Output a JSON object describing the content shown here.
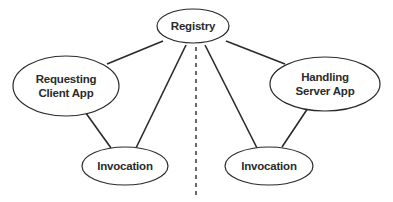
{
  "diagram": {
    "title": "",
    "nodes": [
      {
        "id": "registry",
        "lines": [
          "Registry"
        ],
        "cx": 193,
        "cy": 26,
        "rx": 36,
        "ry": 17
      },
      {
        "id": "client",
        "lines": [
          "Requesting",
          "Client App"
        ],
        "cx": 66,
        "cy": 86,
        "rx": 53,
        "ry": 30
      },
      {
        "id": "server",
        "lines": [
          "Handling",
          "Server App"
        ],
        "cx": 325,
        "cy": 84,
        "rx": 55,
        "ry": 27
      },
      {
        "id": "invocation-left",
        "lines": [
          "Invocation"
        ],
        "cx": 125,
        "cy": 166,
        "rx": 43,
        "ry": 19
      },
      {
        "id": "invocation-right",
        "lines": [
          "Invocation"
        ],
        "cx": 269,
        "cy": 166,
        "rx": 44,
        "ry": 19
      }
    ],
    "edges": [
      {
        "from": "registry",
        "to": "client",
        "x1": 163,
        "y1": 41,
        "x2": 107,
        "y2": 64
      },
      {
        "from": "registry",
        "to": "invocation-left",
        "x1": 186,
        "y1": 45,
        "x2": 136,
        "y2": 148
      },
      {
        "from": "client",
        "to": "invocation-left",
        "x1": 83,
        "y1": 109,
        "x2": 111,
        "y2": 148
      },
      {
        "from": "registry",
        "to": "invocation-right",
        "x1": 205,
        "y1": 45,
        "x2": 257,
        "y2": 148
      },
      {
        "from": "registry",
        "to": "server",
        "x1": 226,
        "y1": 41,
        "x2": 285,
        "y2": 64
      },
      {
        "from": "server",
        "to": "invocation-right",
        "x1": 308,
        "y1": 108,
        "x2": 282,
        "y2": 147
      }
    ],
    "divider": {
      "style": "dashed",
      "x": 196,
      "y1": 47,
      "y2": 197
    },
    "colors": {
      "stroke": "#2a2a2a",
      "text": "#2b2b2b",
      "background": "#ffffff"
    }
  }
}
